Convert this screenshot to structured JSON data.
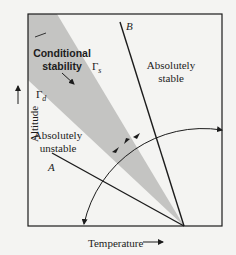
{
  "diagram": {
    "axes": {
      "x_label": "Temperature",
      "x_arrow": "→",
      "y_label": "Altitude",
      "y_arrow": "→"
    },
    "regions": {
      "conditional": {
        "line1": "Conditional",
        "line2": "stability"
      },
      "stable": {
        "line1": "Absolutely",
        "line2": "stable"
      },
      "unstable": {
        "line1": "Absolutely",
        "line2": "unstable"
      }
    },
    "lapse_rates": {
      "saturated": "Γ",
      "saturated_sub": "s",
      "dry": "Γ",
      "dry_sub": "d"
    },
    "lines": {
      "A": "A",
      "B": "B"
    },
    "colors": {
      "shaded_band": "#c4c4c2",
      "line": "#1c1c1c",
      "background": "#f4f4f2"
    }
  }
}
